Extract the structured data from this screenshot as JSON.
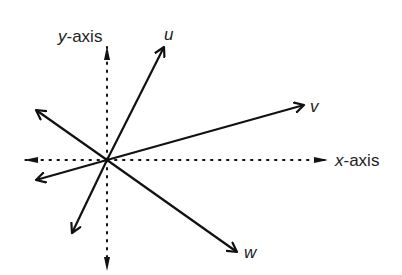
{
  "diagram": {
    "title": "",
    "origin": [
      107,
      160
    ],
    "axes": {
      "x": {
        "label_var": "x",
        "label_rest": "-axis",
        "from": [
          25,
          160
        ],
        "to": [
          327,
          160
        ]
      },
      "y": {
        "label_var": "y",
        "label_rest": "-axis",
        "from": [
          107,
          268
        ],
        "to": [
          107,
          48
        ]
      }
    },
    "vectors": [
      {
        "name": "u",
        "tip": [
          164,
          47
        ],
        "label": "u",
        "label_pos": [
          167,
          38
        ]
      },
      {
        "name": "v",
        "tip": [
          304,
          105
        ],
        "label": "v",
        "label_pos": [
          312,
          111
        ]
      },
      {
        "name": "w",
        "tip": [
          237,
          252
        ],
        "label": "w",
        "label_pos": [
          245,
          258
        ]
      },
      {
        "name": "unlabeled-upper-left",
        "tip": [
          36,
          110
        ],
        "label": ""
      },
      {
        "name": "unlabeled-left",
        "tip": [
          36,
          180
        ],
        "label": ""
      },
      {
        "name": "unlabeled-lower-left",
        "tip": [
          72,
          233
        ],
        "label": ""
      }
    ],
    "colors": {
      "line": "#111111",
      "text": "#222222",
      "background": "#ffffff"
    }
  }
}
